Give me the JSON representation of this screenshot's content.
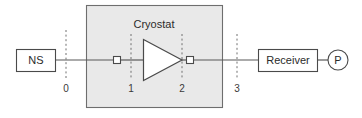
{
  "diagram": {
    "title": "Cryostat",
    "enclosure": {
      "label": "Cryostat"
    },
    "blocks": [
      {
        "id": "noise-source",
        "label": "NS"
      },
      {
        "id": "receiver",
        "label": "Receiver"
      }
    ],
    "amplifier": {
      "label": ""
    },
    "port": {
      "label": "P"
    },
    "reference_planes": [
      {
        "label": "0"
      },
      {
        "label": "1"
      },
      {
        "label": "2"
      },
      {
        "label": "3"
      }
    ],
    "connectors": [
      {
        "id": "connector-1",
        "label": ""
      },
      {
        "id": "connector-2",
        "label": ""
      }
    ],
    "colors": {
      "enclosure_fill": "#e9e9e9",
      "enclosure_stroke": "#6e6e6e",
      "line": "#585858",
      "text": "#2b2b2b",
      "background": "#ffffff"
    }
  }
}
